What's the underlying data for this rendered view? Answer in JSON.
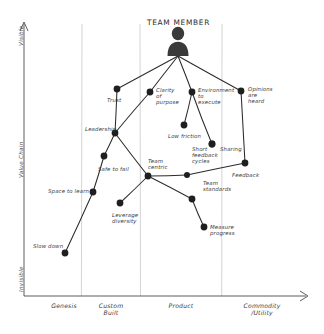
{
  "title": "TEAM MEMBER",
  "colors": {
    "ink": "#2b2b2b",
    "node": "#1f1f1f",
    "grid": "#c9c9c9",
    "axis": "#4a4a4a",
    "paper": "#ffffff"
  },
  "axes": {
    "y": {
      "top_label": "Visible",
      "mid_label": "Value Chain",
      "bottom_label": "Invisible"
    },
    "x": {
      "ticks": [
        "Genesis",
        "Custom\nBuilt",
        "Product",
        "Commodity\n/Utility"
      ]
    }
  },
  "icons": {
    "person": "person-icon",
    "x_arrow": "arrow-right-icon",
    "y_arrow": "arrow-up-icon"
  },
  "chart_data": {
    "type": "scatter",
    "title": "TEAM MEMBER",
    "xlabel": "Evolution",
    "ylabel": "Value Chain",
    "xticks": [
      "Genesis",
      "Custom Built",
      "Product",
      "Commodity /Utility"
    ],
    "ylim": [
      0,
      1
    ],
    "grid": true,
    "legend": "none",
    "nodes": [
      {
        "id": "anchor",
        "label": "TEAM MEMBER",
        "x": 178,
        "y": 56,
        "lx": 147,
        "ly": 18,
        "anchor": true
      },
      {
        "id": "trust",
        "label": "Trust",
        "x": 117,
        "y": 89,
        "lx": 107,
        "ly": 97
      },
      {
        "id": "clarity",
        "label": "Clarity\nof\npurpose",
        "x": 150,
        "y": 92,
        "lx": 156,
        "ly": 87
      },
      {
        "id": "environment",
        "label": "Environment\nto\nexecute",
        "x": 192,
        "y": 92,
        "lx": 198,
        "ly": 87
      },
      {
        "id": "opinions",
        "label": "Opinions\nare\nheard",
        "x": 241,
        "y": 91,
        "lx": 248,
        "ly": 86
      },
      {
        "id": "leadership",
        "label": "Leadership",
        "x": 115,
        "y": 133,
        "lx": 85,
        "ly": 126
      },
      {
        "id": "lowfriction",
        "label": "Low friction",
        "x": 184,
        "y": 125,
        "lx": 168,
        "ly": 133
      },
      {
        "id": "shortcycles",
        "label": "Short\nfeedback\ncycles",
        "x": 212,
        "y": 144,
        "lx": 192,
        "ly": 146
      },
      {
        "id": "sharing",
        "label": "Sharing",
        "x": 212,
        "y": 144,
        "lx": 220,
        "ly": 146,
        "hidden": true
      },
      {
        "id": "feedback",
        "label": "Feedback",
        "x": 245,
        "y": 163,
        "lx": 232,
        "ly": 172
      },
      {
        "id": "safetofail",
        "label": "Safe to fail",
        "x": 104,
        "y": 156,
        "lx": 98,
        "ly": 166
      },
      {
        "id": "teamcentric",
        "label": "Team\ncentric",
        "x": 148,
        "y": 176,
        "lx": 148,
        "ly": 158
      },
      {
        "id": "teamstd",
        "label": "Team\nstandards",
        "x": 192,
        "y": 199,
        "lx": 203,
        "ly": 180
      },
      {
        "id": "fbcycles",
        "label": "",
        "x": 187,
        "y": 175,
        "lx": 0,
        "ly": 0,
        "nolabel": true
      },
      {
        "id": "spacetolearn",
        "label": "Space to learn",
        "x": 93,
        "y": 192,
        "lx": 48,
        "ly": 188
      },
      {
        "id": "leverage",
        "label": "Leverage\ndiversity",
        "x": 120,
        "y": 203,
        "lx": 112,
        "ly": 212
      },
      {
        "id": "measure",
        "label": "Measure\nprogress",
        "x": 204,
        "y": 227,
        "lx": 210,
        "ly": 224
      },
      {
        "id": "slowdown",
        "label": "Slow down",
        "x": 65,
        "y": 253,
        "lx": 33,
        "ly": 243
      }
    ],
    "edges": [
      [
        "anchor",
        "trust"
      ],
      [
        "anchor",
        "clarity"
      ],
      [
        "anchor",
        "environment"
      ],
      [
        "anchor",
        "opinions"
      ],
      [
        "trust",
        "leadership"
      ],
      [
        "clarity",
        "leadership"
      ],
      [
        "environment",
        "lowfriction"
      ],
      [
        "environment",
        "shortcycles"
      ],
      [
        "opinions",
        "feedback"
      ],
      [
        "leadership",
        "safetofail"
      ],
      [
        "leadership",
        "teamcentric"
      ],
      [
        "safetofail",
        "spacetolearn"
      ],
      [
        "spacetolearn",
        "slowdown"
      ],
      [
        "teamcentric",
        "leverage"
      ],
      [
        "teamcentric",
        "fbcycles"
      ],
      [
        "teamcentric",
        "teamstd"
      ],
      [
        "fbcycles",
        "feedback"
      ],
      [
        "teamstd",
        "measure"
      ]
    ],
    "gridlines_x": [
      82,
      140,
      222
    ]
  }
}
